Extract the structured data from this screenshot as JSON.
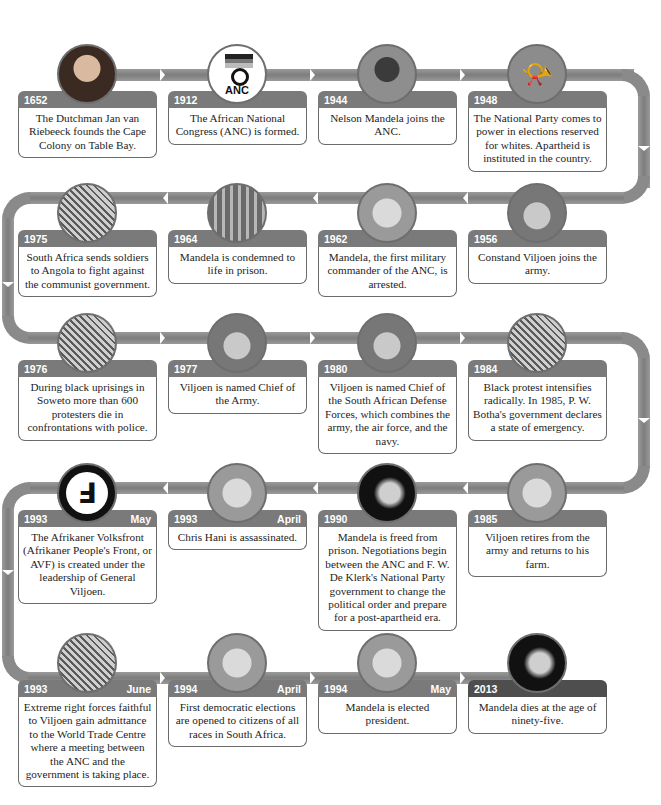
{
  "timeline": {
    "events": [
      {
        "year": "1652",
        "month": "",
        "text": "The Dutchman Jan van Riebeeck founds the Cape Colony on Table Bay.",
        "image": "portrait-van-riebeeck"
      },
      {
        "year": "1912",
        "month": "",
        "text": "The African National Congress (ANC) is formed.",
        "image": "anc-logo",
        "logo_text": "ANC"
      },
      {
        "year": "1944",
        "month": "",
        "text": "Nelson Mandela joins the ANC.",
        "image": "young-mandela-photo"
      },
      {
        "year": "1948",
        "month": "",
        "text": "The National Party comes to power in elections reserved for whites. Apartheid is instituted in the country.",
        "image": "national-party-horn-emblem"
      },
      {
        "year": "1956",
        "month": "",
        "text": "Constand Viljoen joins the army.",
        "image": "viljoen-beret-drawing"
      },
      {
        "year": "1962",
        "month": "",
        "text": "Mandela, the first military commander of the ANC, is arrested.",
        "image": "mandela-arrest-drawing",
        "sign_text": "ROORDE"
      },
      {
        "year": "1964",
        "month": "",
        "text": "Mandela is condemned to life in prison.",
        "image": "prison-bars-photo"
      },
      {
        "year": "1975",
        "month": "",
        "text": "South Africa sends soldiers to Angola to fight against the communist government.",
        "image": "angola-soldiers-drawing"
      },
      {
        "year": "1976",
        "month": "",
        "text": "During black uprisings in Soweto more than 600 protesters die in confrontations with police.",
        "image": "soweto-uprising-drawing"
      },
      {
        "year": "1977",
        "month": "",
        "text": "Viljoen is named Chief of the Army.",
        "image": "viljoen-chief-army-drawing"
      },
      {
        "year": "1980",
        "month": "",
        "text": "Viljoen is named Chief of the South African Defense Forces, which combines the army, the air force, and the navy.",
        "image": "viljoen-general-drawing"
      },
      {
        "year": "1984",
        "month": "",
        "text": "Black protest intensifies radically. In 1985, P. W. Botha's government declares a state of emergency.",
        "image": "protest-crowd-drawing"
      },
      {
        "year": "1985",
        "month": "",
        "text": "Viljoen retires from the army and returns to his farm.",
        "image": "viljoen-farmer-hat-drawing"
      },
      {
        "year": "1990",
        "month": "",
        "text": "Mandela is freed from prison. Negotiations begin between the ANC and F. W. De Klerk's National Party government to change the political order and prepare for a post-apartheid era.",
        "image": "mandela-freed-drawing"
      },
      {
        "year": "1993",
        "month": "April",
        "text": "Chris Hani is assassinated.",
        "image": "chris-hani-drawing"
      },
      {
        "year": "1993",
        "month": "May",
        "text": "The Afrikaner Volksfront (Afrikaner People's Front, or AVF) is created under the leadership of General Viljoen.",
        "image": "avf-triskelion-emblem"
      },
      {
        "year": "1993",
        "month": "June",
        "text": "Extreme right forces faithful to Viljoen gain admittance to the World Trade Centre where a meeting between the ANC and the government is taking place.",
        "image": "world-trade-centre-storming-drawing"
      },
      {
        "year": "1994",
        "month": "April",
        "text": "First democratic elections are opened to citizens of all races in South Africa.",
        "image": "voting-booth-drawing"
      },
      {
        "year": "1994",
        "month": "May",
        "text": "Mandela is elected president.",
        "image": "mandela-president-drawing"
      },
      {
        "year": "2013",
        "month": "",
        "text": "Mandela dies at the age of ninety-five.",
        "image": "elderly-mandela-portrait"
      }
    ]
  },
  "colors": {
    "header": "#7a7a7a",
    "header_final": "#4e4e4e",
    "track": "#8a8a8a",
    "card_border": "#6a6a6a",
    "text": "#1d1d1d",
    "background": "#ffffff"
  }
}
